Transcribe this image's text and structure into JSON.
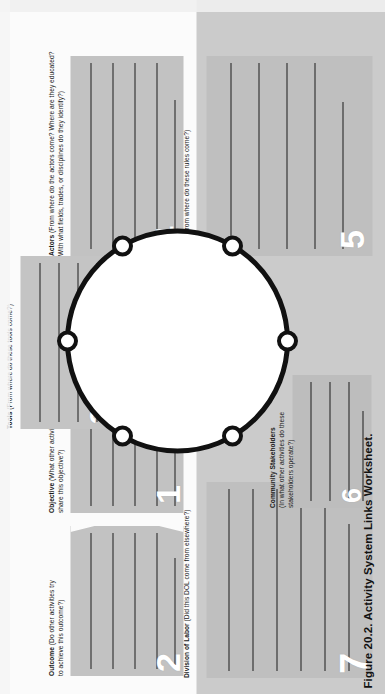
{
  "figure": {
    "caption": "Figure 20.2. Activity System Links Worksheet."
  },
  "sections": [
    {
      "id": "objective",
      "number": "1",
      "title": "Objective",
      "question": "(What other activities share this objective?)",
      "question_line1": "(What other activities",
      "question_line2": "share this objective?)",
      "lines": 5
    },
    {
      "id": "outcome",
      "number": "2",
      "title": "Outcome",
      "question": "(Do other activities try to achieve this outcome?)",
      "question_line1": "(Do other activities try",
      "question_line2": "to achieve this outcome?)",
      "lines": 5
    },
    {
      "id": "tools",
      "number": "3",
      "title": "Tools",
      "question": "(From where do these tools come?)",
      "question_line1": "(From where do these tools come?)",
      "question_line2": "",
      "lines": 5
    },
    {
      "id": "actors",
      "number": "4",
      "title": "Actors",
      "question": "(From where do the actors come? Where are they educated? With what fields, trades, or disciplines do they identify?)",
      "question_line1": "(From where do the actors come? Where are they educated?",
      "question_line2": "With what fields, trades, or disciplines do they identify?)",
      "lines": 5
    },
    {
      "id": "rules",
      "number": "5",
      "title": "Rules",
      "question": "(From where do these rules come?)",
      "question_line1": "(From where do these rules come?)",
      "question_line2": "",
      "lines": 5
    },
    {
      "id": "community-stakeholders",
      "number": "6",
      "title": "Community Stakeholders",
      "question": "(In what other activities do these stakeholders operate?)",
      "question_line1": "(In what other activities do these",
      "question_line2": "stakeholders operate?)",
      "lines": 4
    },
    {
      "id": "division-of-labor",
      "number": "7",
      "title": "Division of Labor",
      "question": "(Did this DOL come from elsewhere?)",
      "question_line1": "(Did this DOL come from elsewhere?)",
      "question_line2": "",
      "lines": 6
    }
  ],
  "diagram": {
    "shape": "circle",
    "node_count": 6,
    "node_label": "",
    "stroke_color": "#111111",
    "node_fill": "#ffffff"
  },
  "colors": {
    "panel_gray": "#c3c3c3",
    "page_white": "#fdfdfd",
    "number_white": "#ffffff",
    "ink": "#1a1a1a"
  }
}
